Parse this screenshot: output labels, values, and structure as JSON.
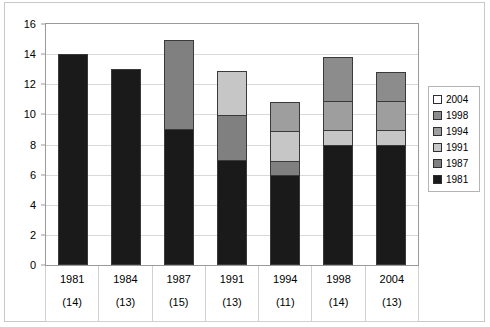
{
  "title_sliver": "",
  "chart_data": {
    "type": "bar",
    "title": "",
    "subtitle": "",
    "xlabel": "",
    "ylabel": "",
    "stacked": true,
    "grid": true,
    "legend_position": "right",
    "ylim": [
      0,
      16
    ],
    "ytick_step": 2,
    "yticks": [
      0,
      2,
      4,
      6,
      8,
      10,
      12,
      14,
      16
    ],
    "categories": [
      "1981",
      "1984",
      "1987",
      "1991",
      "1994",
      "1998",
      "2004"
    ],
    "category_totals": [
      "(14)",
      "(13)",
      "(15)",
      "(13)",
      "(11)",
      "(14)",
      "(13)"
    ],
    "totals_numeric": [
      14,
      13,
      15,
      13,
      11,
      14,
      13
    ],
    "series": [
      {
        "name": "1981",
        "color": "#1a1a1a",
        "values": [
          14,
          13,
          9,
          7,
          6,
          8,
          8
        ]
      },
      {
        "name": "1987",
        "color": "#808080",
        "values": [
          0,
          0,
          6,
          3,
          1,
          0,
          0
        ]
      },
      {
        "name": "1991",
        "color": "#c6c6c6",
        "values": [
          0,
          0,
          0,
          3,
          2,
          1,
          1
        ]
      },
      {
        "name": "1994",
        "color": "#9e9e9e",
        "values": [
          0,
          0,
          0,
          0,
          2,
          2,
          2
        ]
      },
      {
        "name": "1998",
        "color": "#8c8c8c",
        "values": [
          0,
          0,
          0,
          0,
          0,
          3,
          2
        ]
      },
      {
        "name": "2004",
        "color": "#ffffff",
        "values": [
          0,
          0,
          0,
          0,
          0,
          0,
          0
        ]
      }
    ],
    "legend_order": [
      "2004",
      "1998",
      "1994",
      "1991",
      "1987",
      "1981"
    ]
  }
}
